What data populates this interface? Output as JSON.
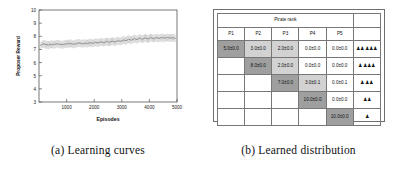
{
  "figure": {
    "panel_a": {
      "caption": "(a) Learning curves"
    },
    "panel_b": {
      "caption": "(b) Learned distribution"
    }
  },
  "chart_data": {
    "type": "line",
    "title": "",
    "xlabel": "Episodes",
    "ylabel": "Proposer Reward",
    "xlim": [
      0,
      5000
    ],
    "ylim": [
      3,
      10
    ],
    "xticks": [
      "1000",
      "2000",
      "3000",
      "4000",
      "5000"
    ],
    "xtick_values": [
      1000,
      2000,
      3000,
      4000,
      5000
    ],
    "yticks": [
      "3",
      "4",
      "5",
      "6",
      "7",
      "8",
      "9",
      "10"
    ],
    "ytick_values": [
      3,
      4,
      5,
      6,
      7,
      8,
      9,
      10
    ],
    "grid": false,
    "legend": "none",
    "line_color": "#8c8c8c",
    "band_color": "#d8d8d8",
    "series": [
      {
        "name": "Proposer Reward",
        "x": [
          50,
          150,
          250,
          350,
          450,
          550,
          650,
          750,
          850,
          950,
          1050,
          1150,
          1250,
          1350,
          1450,
          1550,
          1650,
          1750,
          1850,
          1950,
          2050,
          2150,
          2250,
          2350,
          2450,
          2550,
          2650,
          2750,
          2850,
          2950,
          3050,
          3150,
          3250,
          3350,
          3450,
          3550,
          3650,
          3750,
          3850,
          3950,
          4050,
          4150,
          4250,
          4350,
          4450,
          4550,
          4650,
          4750,
          4850,
          4950
        ],
        "values": [
          7.3,
          7.42,
          7.38,
          7.33,
          7.4,
          7.36,
          7.44,
          7.39,
          7.35,
          7.43,
          7.41,
          7.47,
          7.38,
          7.45,
          7.5,
          7.42,
          7.48,
          7.44,
          7.52,
          7.46,
          7.55,
          7.49,
          7.58,
          7.52,
          7.6,
          7.55,
          7.63,
          7.57,
          7.66,
          7.61,
          7.72,
          7.66,
          7.78,
          7.7,
          7.83,
          7.74,
          7.86,
          7.77,
          7.88,
          7.8,
          7.9,
          7.82,
          7.89,
          7.84,
          7.91,
          7.85,
          7.92,
          7.86,
          7.9,
          7.83
        ],
        "band_lower": [
          7.05,
          7.12,
          7.08,
          7.02,
          7.1,
          7.06,
          7.14,
          7.09,
          7.05,
          7.13,
          7.11,
          7.17,
          7.08,
          7.15,
          7.2,
          7.12,
          7.18,
          7.14,
          7.22,
          7.16,
          7.25,
          7.19,
          7.28,
          7.22,
          7.3,
          7.25,
          7.33,
          7.27,
          7.36,
          7.31,
          7.42,
          7.36,
          7.48,
          7.4,
          7.53,
          7.44,
          7.56,
          7.47,
          7.58,
          7.5,
          7.6,
          7.52,
          7.59,
          7.54,
          7.61,
          7.55,
          7.62,
          7.56,
          7.6,
          7.53
        ],
        "band_upper": [
          7.55,
          7.72,
          7.68,
          7.63,
          7.7,
          7.66,
          7.74,
          7.69,
          7.65,
          7.73,
          7.71,
          7.77,
          7.68,
          7.75,
          7.8,
          7.72,
          7.78,
          7.74,
          7.82,
          7.76,
          7.85,
          7.79,
          7.88,
          7.82,
          7.9,
          7.85,
          7.93,
          7.87,
          7.96,
          7.91,
          8.02,
          7.96,
          8.08,
          8.0,
          8.13,
          8.04,
          8.16,
          8.07,
          8.18,
          8.1,
          8.2,
          8.12,
          8.19,
          8.14,
          8.21,
          8.15,
          8.22,
          8.16,
          8.2,
          8.13
        ]
      }
    ]
  },
  "table": {
    "group_header": "Pirate rank",
    "columns": [
      "P1",
      "P2",
      "P3",
      "P4",
      "P5"
    ],
    "rows": [
      {
        "cells": [
          "5.0±0.0",
          "3.0±0.0",
          "2.0±0.0",
          "0.0±0.0",
          "0.0±0.0"
        ],
        "styles": [
          "diag",
          "mid",
          "mid",
          "light",
          "light"
        ],
        "icons": "♟♟♟♟♟"
      },
      {
        "cells": [
          "",
          "8.0±0.0",
          "2.0±0.0",
          "0.0±0.0",
          "0.0±0.0"
        ],
        "styles": [
          "blank",
          "diag",
          "mid",
          "light",
          "light"
        ],
        "icons": "♟♟♟♟"
      },
      {
        "cells": [
          "",
          "",
          "7.0±0.0",
          "3.0±0.1",
          "0.0±0.1"
        ],
        "styles": [
          "blank",
          "blank",
          "diag",
          "mid",
          "light"
        ],
        "icons": "♟♟♟"
      },
      {
        "cells": [
          "",
          "",
          "",
          "10.0±0.0",
          "0.0±0.0"
        ],
        "styles": [
          "blank",
          "blank",
          "blank",
          "diag",
          "light"
        ],
        "icons": "♟♟"
      },
      {
        "cells": [
          "",
          "",
          "",
          "",
          "10.0±0.0"
        ],
        "styles": [
          "blank",
          "blank",
          "blank",
          "blank",
          "diag"
        ],
        "icons": "♟"
      }
    ]
  }
}
